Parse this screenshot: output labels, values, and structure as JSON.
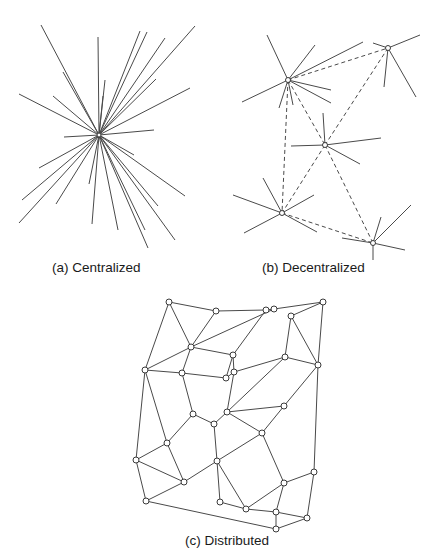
{
  "captions": {
    "centralized": "(a) Centralized",
    "decentralized": "(b) Decentralized",
    "distributed": "(c) Distributed"
  },
  "colors": {
    "line": "#4a4a4a",
    "node_fill": "#ffffff",
    "node_stroke": "#3a3a3a"
  },
  "centralized": {
    "center": [
      99,
      135
    ],
    "spokes": [
      [
        41,
        25
      ],
      [
        98,
        37
      ],
      [
        140,
        31
      ],
      [
        147,
        32
      ],
      [
        165,
        38
      ],
      [
        195,
        26
      ],
      [
        63,
        72
      ],
      [
        19,
        94
      ],
      [
        53,
        96
      ],
      [
        105,
        80
      ],
      [
        103,
        96
      ],
      [
        156,
        79
      ],
      [
        190,
        88
      ],
      [
        64,
        137
      ],
      [
        154,
        130
      ],
      [
        39,
        168
      ],
      [
        134,
        155
      ],
      [
        22,
        200
      ],
      [
        56,
        204
      ],
      [
        19,
        223
      ],
      [
        89,
        184
      ],
      [
        92,
        224
      ],
      [
        118,
        230
      ],
      [
        148,
        248
      ],
      [
        145,
        230
      ],
      [
        158,
        206
      ],
      [
        175,
        240
      ],
      [
        185,
        196
      ]
    ]
  },
  "decentralized": {
    "hubs": [
      {
        "x": 288,
        "y": 80,
        "spokes": [
          [
            267,
            35
          ],
          [
            315,
            45
          ],
          [
            363,
            42
          ],
          [
            242,
            102
          ],
          [
            331,
            90
          ],
          [
            331,
            103
          ],
          [
            279,
            108
          ],
          [
            293,
            105
          ]
        ]
      },
      {
        "x": 388,
        "y": 48,
        "spokes": [
          [
            373,
            43
          ],
          [
            420,
            35
          ],
          [
            384,
            87
          ],
          [
            416,
            97
          ]
        ]
      },
      {
        "x": 325,
        "y": 145,
        "spokes": [
          [
            323,
            113
          ],
          [
            291,
            146
          ],
          [
            381,
            138
          ],
          [
            360,
            164
          ]
        ]
      },
      {
        "x": 282,
        "y": 213,
        "spokes": [
          [
            263,
            178
          ],
          [
            233,
            195
          ],
          [
            314,
            195
          ],
          [
            244,
            233
          ],
          [
            317,
            232
          ]
        ]
      },
      {
        "x": 373,
        "y": 243,
        "spokes": [
          [
            342,
            238
          ],
          [
            381,
            217
          ],
          [
            411,
            205
          ],
          [
            405,
            250
          ],
          [
            373,
            260
          ]
        ]
      }
    ],
    "dashed_links": [
      [
        0,
        1
      ],
      [
        0,
        2
      ],
      [
        1,
        2
      ],
      [
        0,
        3
      ],
      [
        2,
        3
      ],
      [
        2,
        4
      ],
      [
        3,
        4
      ]
    ]
  },
  "distributed": {
    "nodes": [
      [
        169,
        302
      ],
      [
        216,
        311
      ],
      [
        266,
        310
      ],
      [
        274,
        309
      ],
      [
        323,
        302
      ],
      [
        291,
        316
      ],
      [
        191,
        347
      ],
      [
        233,
        355
      ],
      [
        285,
        357
      ],
      [
        318,
        365
      ],
      [
        145,
        370
      ],
      [
        182,
        373
      ],
      [
        226,
        378
      ],
      [
        234,
        372
      ],
      [
        284,
        406
      ],
      [
        193,
        414
      ],
      [
        227,
        412
      ],
      [
        214,
        424
      ],
      [
        262,
        433
      ],
      [
        167,
        443
      ],
      [
        136,
        460
      ],
      [
        217,
        461
      ],
      [
        184,
        482
      ],
      [
        314,
        472
      ],
      [
        284,
        483
      ],
      [
        146,
        501
      ],
      [
        220,
        502
      ],
      [
        246,
        509
      ],
      [
        276,
        512
      ],
      [
        307,
        518
      ],
      [
        276,
        529
      ]
    ],
    "edges": [
      [
        0,
        1
      ],
      [
        0,
        6
      ],
      [
        0,
        10
      ],
      [
        1,
        2
      ],
      [
        1,
        6
      ],
      [
        2,
        3
      ],
      [
        2,
        7
      ],
      [
        3,
        4
      ],
      [
        3,
        6
      ],
      [
        4,
        5
      ],
      [
        4,
        9
      ],
      [
        5,
        8
      ],
      [
        5,
        9
      ],
      [
        6,
        7
      ],
      [
        6,
        10
      ],
      [
        6,
        11
      ],
      [
        7,
        13
      ],
      [
        7,
        12
      ],
      [
        8,
        9
      ],
      [
        8,
        13
      ],
      [
        8,
        16
      ],
      [
        9,
        14
      ],
      [
        9,
        23
      ],
      [
        10,
        11
      ],
      [
        10,
        19
      ],
      [
        10,
        20
      ],
      [
        11,
        12
      ],
      [
        11,
        15
      ],
      [
        12,
        13
      ],
      [
        13,
        16
      ],
      [
        14,
        16
      ],
      [
        14,
        18
      ],
      [
        15,
        17
      ],
      [
        15,
        19
      ],
      [
        16,
        17
      ],
      [
        16,
        18
      ],
      [
        17,
        21
      ],
      [
        18,
        21
      ],
      [
        18,
        24
      ],
      [
        19,
        20
      ],
      [
        19,
        22
      ],
      [
        20,
        22
      ],
      [
        20,
        25
      ],
      [
        21,
        22
      ],
      [
        21,
        26
      ],
      [
        21,
        27
      ],
      [
        22,
        25
      ],
      [
        23,
        24
      ],
      [
        23,
        29
      ],
      [
        24,
        27
      ],
      [
        24,
        28
      ],
      [
        25,
        30
      ],
      [
        26,
        27
      ],
      [
        27,
        28
      ],
      [
        28,
        29
      ],
      [
        28,
        30
      ],
      [
        29,
        30
      ]
    ]
  }
}
